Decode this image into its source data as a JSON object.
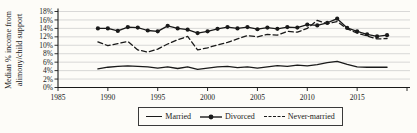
{
  "figure": {
    "background": "#fdfcf8",
    "ink_color": "#1a1a1a",
    "gridline_color": "#c9c9c9"
  },
  "chart_data": {
    "type": "line",
    "title": "",
    "xlabel": "",
    "ylabel": "Median % income from alimony/child support",
    "ylabel_line1": "Median % income from",
    "ylabel_line2": "alimony/child support",
    "ylim": [
      0,
      18
    ],
    "xlim": [
      1985,
      2020
    ],
    "y_tick_step": 2,
    "y_ticks": [
      "0%",
      "2%",
      "4%",
      "6%",
      "8%",
      "10%",
      "12%",
      "14%",
      "16%",
      "18%"
    ],
    "x_tick_step": 5,
    "x_tick_labels": [
      "1985",
      "1990",
      "1995",
      "2000",
      "2005",
      "2010",
      "2015"
    ],
    "grid": "horizontal",
    "legend_position": "bottom-center",
    "years": [
      1989,
      1990,
      1991,
      1992,
      1993,
      1994,
      1995,
      1996,
      1997,
      1998,
      1999,
      2000,
      2001,
      2002,
      2003,
      2004,
      2005,
      2006,
      2007,
      2008,
      2009,
      2010,
      2011,
      2012,
      2013,
      2014,
      2015,
      2016,
      2017,
      2018
    ],
    "series": [
      {
        "name": "Married",
        "line_style": "solid",
        "marker": "none",
        "values": [
          4.4,
          4.8,
          5.0,
          5.1,
          5.0,
          4.9,
          4.6,
          4.9,
          4.5,
          4.9,
          4.3,
          4.6,
          4.9,
          5.0,
          4.7,
          4.9,
          4.6,
          4.9,
          5.2,
          5.0,
          5.3,
          5.1,
          5.4,
          5.9,
          6.2,
          5.5,
          4.9,
          4.8,
          4.8,
          4.8
        ]
      },
      {
        "name": "Divorced",
        "line_style": "solid",
        "marker": "filled-circle",
        "values": [
          14.0,
          14.0,
          13.4,
          14.3,
          14.2,
          13.5,
          13.3,
          14.6,
          14.0,
          13.7,
          12.9,
          13.3,
          13.9,
          14.3,
          14.0,
          14.3,
          13.8,
          14.2,
          13.9,
          14.3,
          14.2,
          14.9,
          14.7,
          15.3,
          16.3,
          14.1,
          13.3,
          12.6,
          12.1,
          12.4
        ]
      },
      {
        "name": "Never-married",
        "line_style": "dashed",
        "marker": "none",
        "values": [
          10.8,
          9.9,
          10.4,
          10.9,
          8.9,
          8.4,
          9.1,
          10.3,
          11.3,
          12.1,
          8.9,
          9.4,
          10.1,
          10.7,
          11.5,
          12.3,
          12.0,
          12.6,
          12.4,
          13.3,
          13.1,
          14.0,
          15.9,
          15.1,
          15.6,
          13.9,
          12.9,
          12.2,
          11.5,
          11.6
        ]
      }
    ]
  }
}
